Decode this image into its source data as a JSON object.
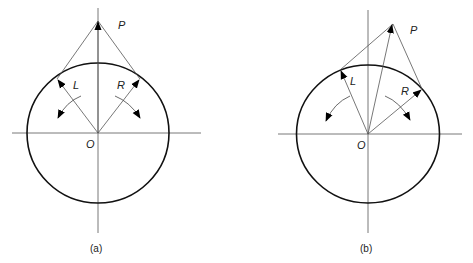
{
  "figure": {
    "panels": [
      {
        "id": "a",
        "caption": "(a)",
        "labels": {
          "point": "P",
          "left": "L",
          "right": "R",
          "origin": "O"
        }
      },
      {
        "id": "b",
        "caption": "(b)",
        "labels": {
          "point": "P",
          "left": "L",
          "right": "R",
          "origin": "O"
        }
      }
    ]
  }
}
